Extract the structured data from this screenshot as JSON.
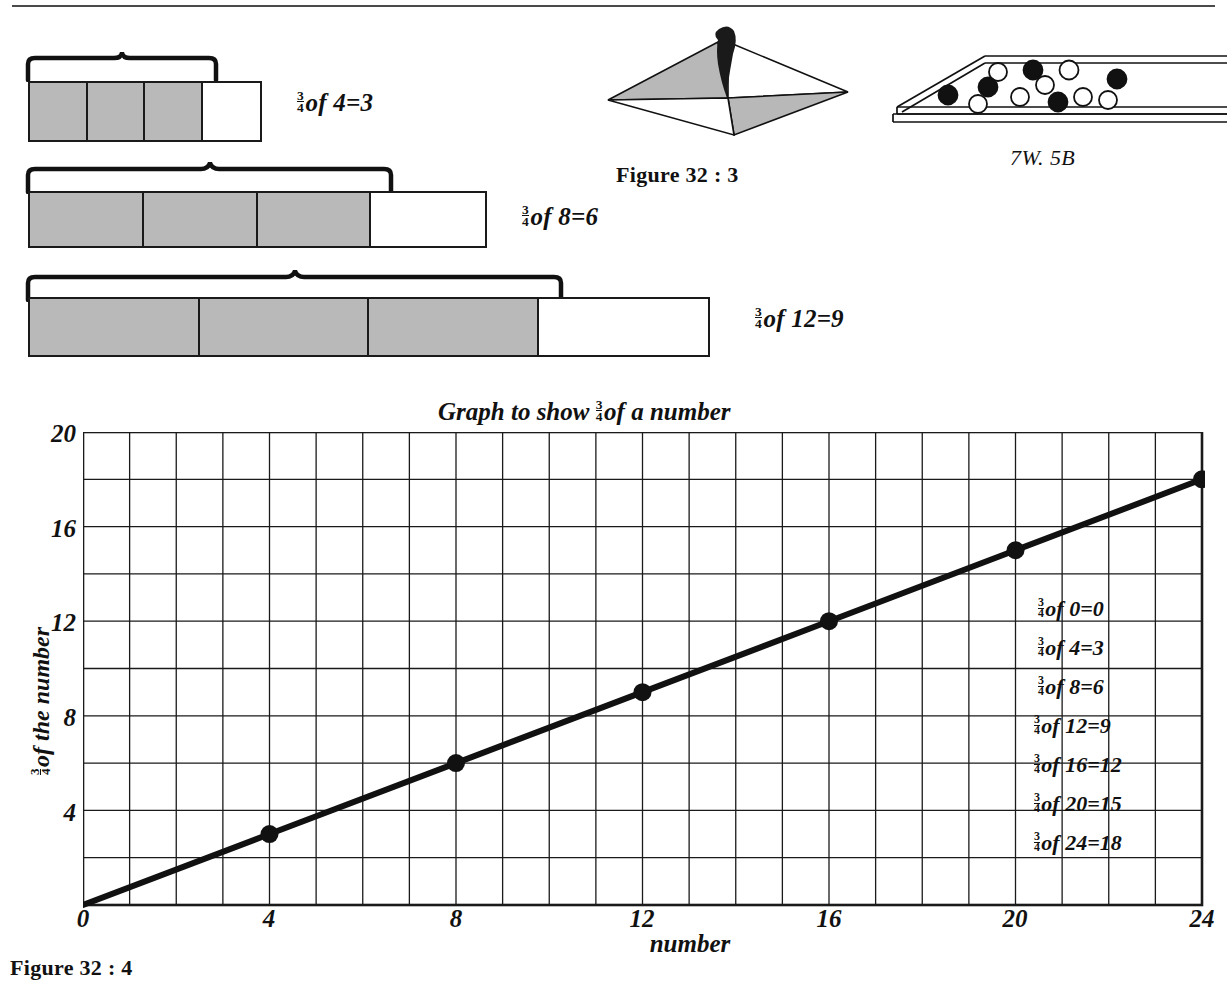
{
  "page": {
    "top_rule": true,
    "bottom_caption": "Figure 32 : 4"
  },
  "bar_diagrams": [
    {
      "id": "bar-4",
      "total_cells": 4,
      "shaded_cells": 3,
      "brace_cells": 3,
      "label_numerator": "3",
      "label_denominator": "4",
      "label_text": "of 4=3",
      "equation": "3/4 of 4 = 3"
    },
    {
      "id": "bar-8",
      "total_cells": 4,
      "shaded_cells": 3,
      "brace_cells": 3,
      "label_numerator": "3",
      "label_denominator": "4",
      "label_text": "of 8=6",
      "equation": "3/4 of 8 = 6"
    },
    {
      "id": "bar-12",
      "total_cells": 4,
      "shaded_cells": 3,
      "brace_cells": 3,
      "label_numerator": "3",
      "label_denominator": "4",
      "label_text": "of 12=9",
      "equation": "3/4 of 12 = 9"
    }
  ],
  "middle_figure": {
    "caption": "Figure 32 : 3",
    "description": "kite-shaped quadrilateral with two shaded triangles and a dark blob"
  },
  "right_figure": {
    "caption": "7W. 5B",
    "black_balls": 5,
    "white_balls": 7
  },
  "graph": {
    "title_prefix": "Graph to show",
    "title_numerator": "3",
    "title_denominator": "4",
    "title_suffix": "of a number",
    "xlabel": "number",
    "ylabel_numerator": "3",
    "ylabel_denominator": "4",
    "ylabel_suffix": "of the number",
    "x_ticks": [
      "0",
      "4",
      "8",
      "12",
      "16",
      "20",
      "24"
    ],
    "y_ticks": [
      "4",
      "8",
      "12",
      "16",
      "20"
    ]
  },
  "chart_data": {
    "type": "line",
    "xlabel": "number",
    "ylabel": "3/4 of the number",
    "x": [
      0,
      4,
      8,
      12,
      16,
      20,
      24
    ],
    "values": [
      0,
      3,
      6,
      9,
      12,
      15,
      18
    ],
    "series": [
      {
        "name": "3/4 of a number",
        "values": [
          0,
          3,
          6,
          9,
          12,
          15,
          18
        ]
      }
    ],
    "xlim": [
      0,
      24
    ],
    "ylim": [
      0,
      20
    ],
    "x_ticks": [
      0,
      4,
      8,
      12,
      16,
      20,
      24
    ],
    "y_ticks": [
      0,
      4,
      8,
      12,
      16,
      20
    ],
    "x_gridline_step": 1,
    "y_gridline_step": 2,
    "grid": true,
    "legend": "none",
    "markers": "filled-circle",
    "annotations": [
      {
        "numerator": "3",
        "denominator": "4",
        "text": "of 0=0",
        "equation": "3/4 of 0 = 0"
      },
      {
        "numerator": "3",
        "denominator": "4",
        "text": "of 4=3",
        "equation": "3/4 of 4 = 3"
      },
      {
        "numerator": "3",
        "denominator": "4",
        "text": "of 8=6",
        "equation": "3/4 of 8 = 6"
      },
      {
        "numerator": "3",
        "denominator": "4",
        "text": "of 12=9",
        "equation": "3/4 of 12 = 9"
      },
      {
        "numerator": "3",
        "denominator": "4",
        "text": "of 16=12",
        "equation": "3/4 of 16 = 12"
      },
      {
        "numerator": "3",
        "denominator": "4",
        "text": "of 20=15",
        "equation": "3/4 of 20 = 15"
      },
      {
        "numerator": "3",
        "denominator": "4",
        "text": "of 24=18",
        "equation": "3/4 of 24 = 18"
      }
    ]
  },
  "colors": {
    "ink": "#111111",
    "shade": "#b9b9b9",
    "grid": "#1a1a1a"
  }
}
